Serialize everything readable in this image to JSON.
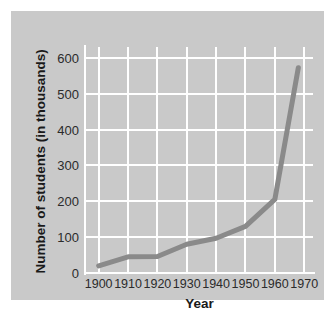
{
  "chart_data": {
    "type": "line",
    "title": "",
    "xlabel": "Year",
    "ylabel": "Number of students (in thousands)",
    "xlim": [
      1895,
      1973
    ],
    "ylim": [
      0,
      630
    ],
    "xticks": [
      1900,
      1910,
      1920,
      1930,
      1940,
      1950,
      1960,
      1970
    ],
    "xtick_labels": [
      "1900",
      "1910",
      "1920",
      "1930",
      "1940",
      "1950",
      "1960",
      "1970"
    ],
    "yticks": [
      0,
      100,
      200,
      300,
      400,
      500,
      600
    ],
    "ytick_labels": [
      "0",
      "100",
      "200",
      "300",
      "400",
      "500",
      "600"
    ],
    "grid": true,
    "grid_color": "#ffffff",
    "legend": null,
    "series": [
      {
        "name": "Number of students",
        "color": "#8a8a8a",
        "line_width": 5,
        "x": [
          1900,
          1910,
          1920,
          1930,
          1940,
          1950,
          1960,
          1968
        ],
        "values": [
          20,
          45,
          46,
          80,
          97,
          130,
          205,
          572
        ]
      }
    ],
    "background_color": "#c9c9c9",
    "figure_color": "#ffffff",
    "text_color": "#2b2b2b"
  }
}
